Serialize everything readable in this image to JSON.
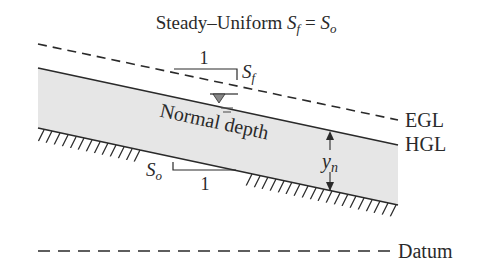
{
  "title": {
    "prefix": "Steady–Uniform ",
    "lhs_main": "S",
    "lhs_sub": "f",
    "equals": " = ",
    "rhs_main": "S",
    "rhs_sub": "o"
  },
  "slope_triangles": {
    "friction": {
      "run_label": "1",
      "rise_main": "S",
      "rise_sub": "f"
    },
    "bed": {
      "run_label": "1",
      "rise_main": "S",
      "rise_sub": "o"
    }
  },
  "labels": {
    "egl": "EGL",
    "hgl": "HGL",
    "datum": "Datum",
    "normal_depth": "Normal depth",
    "depth_main": "y",
    "depth_sub": "n"
  },
  "colors": {
    "water_fill": "#e6e6e6",
    "line": "#2a2a2a",
    "background": "#ffffff"
  }
}
